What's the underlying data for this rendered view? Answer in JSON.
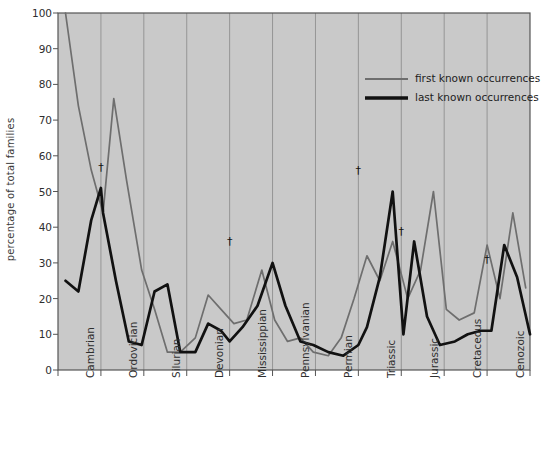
{
  "figure": {
    "background_plot": "#c9c9c9",
    "background_page": "#ffffff",
    "axis_color": "#555555",
    "gridline_color": "#8f8f8f"
  },
  "legend": {
    "position": "top-right-inside",
    "entries": [
      {
        "label": "first known occurrences",
        "color": "#6e6e6e",
        "width": 1.6
      },
      {
        "label": "last known occurrences",
        "color": "#111111",
        "width": 2.6
      }
    ]
  },
  "annotations": {
    "symbol": "†",
    "markers": [
      {
        "period": "Cambrian-Ordovician",
        "x": 2.0,
        "y": 57
      },
      {
        "period": "Devonian-Mississippian",
        "x": 8.0,
        "y": 36
      },
      {
        "period": "Permian-Triassic",
        "x": 14.0,
        "y": 56
      },
      {
        "period": "Triassic-Jurassic",
        "x": 16.0,
        "y": 39
      },
      {
        "period": "Cretaceous-Cenozoic",
        "x": 20.0,
        "y": 31
      }
    ]
  },
  "chart_data": {
    "type": "line",
    "title": "",
    "xlabel": "",
    "ylabel": "percentage of total families",
    "ylim": [
      0,
      100
    ],
    "yticks": [
      0,
      10,
      20,
      30,
      40,
      50,
      60,
      70,
      80,
      90,
      100
    ],
    "ytick_labels": [
      "0",
      "10",
      "20",
      "30",
      "40",
      "50",
      "60",
      "70",
      "80",
      "90",
      "100"
    ],
    "grid": "vertical period dividers only",
    "legend_position": "upper right",
    "categories": [
      "Cambrian",
      "Ordovician",
      "Silurian",
      "Devonian",
      "Mississippian",
      "Pennsylvanian",
      "Permian",
      "Triassic",
      "Jurassic",
      "Cretaceous",
      "Cenozoic"
    ],
    "category_boundaries_x": [
      0,
      2,
      4,
      6,
      8,
      10,
      12,
      14,
      16,
      18,
      20,
      22
    ],
    "series": [
      {
        "name": "first known occurrences",
        "color": "#6e6e6e",
        "x": [
          0.35,
          0.95,
          1.55,
          2.1,
          2.6,
          3.2,
          3.9,
          4.5,
          5.1,
          5.7,
          6.4,
          7.0,
          7.6,
          8.2,
          8.8,
          9.5,
          10.1,
          10.7,
          11.3,
          11.9,
          12.6,
          13.2,
          13.8,
          14.4,
          15.0,
          15.6,
          16.3,
          16.9,
          17.5,
          18.1,
          18.7,
          19.4,
          20.0,
          20.6,
          21.2,
          21.8
        ],
        "values": [
          100,
          74,
          56,
          44,
          76,
          53,
          28,
          17,
          5,
          5,
          9,
          21,
          17,
          13,
          14,
          28,
          14,
          8,
          9,
          5,
          4,
          9,
          20,
          32,
          25,
          36,
          20,
          28,
          50,
          17,
          14,
          16,
          35,
          20,
          44,
          23
        ]
      },
      {
        "name": "last known occurrences",
        "color": "#111111",
        "x": [
          0.35,
          0.95,
          1.55,
          2.0,
          2.1,
          2.7,
          3.3,
          3.9,
          4.5,
          5.1,
          5.7,
          6.4,
          7.0,
          7.6,
          8.0,
          8.6,
          9.3,
          10.0,
          10.6,
          11.3,
          11.9,
          12.6,
          13.3,
          14.0,
          14.4,
          15.0,
          15.6,
          16.1,
          16.6,
          17.2,
          17.8,
          18.5,
          19.1,
          19.7,
          20.2,
          20.8,
          21.4,
          22.0
        ],
        "values": [
          25,
          22,
          42,
          51,
          44,
          25,
          8,
          7,
          22,
          24,
          5,
          5,
          13,
          11,
          8,
          12,
          18,
          30,
          18,
          8,
          7,
          5,
          4,
          7,
          12,
          26,
          50,
          10,
          36,
          15,
          7,
          8,
          10,
          11,
          11,
          35,
          26,
          10
        ]
      }
    ]
  }
}
